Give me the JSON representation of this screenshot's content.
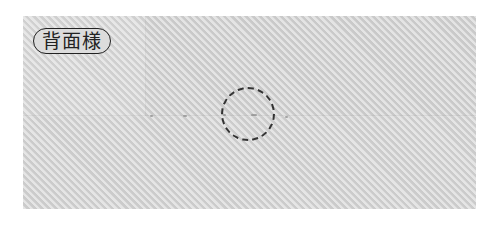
{
  "figure": {
    "label": "背面様",
    "colors": {
      "fabric": "#d6d6d6",
      "outline": "#222222"
    }
  }
}
